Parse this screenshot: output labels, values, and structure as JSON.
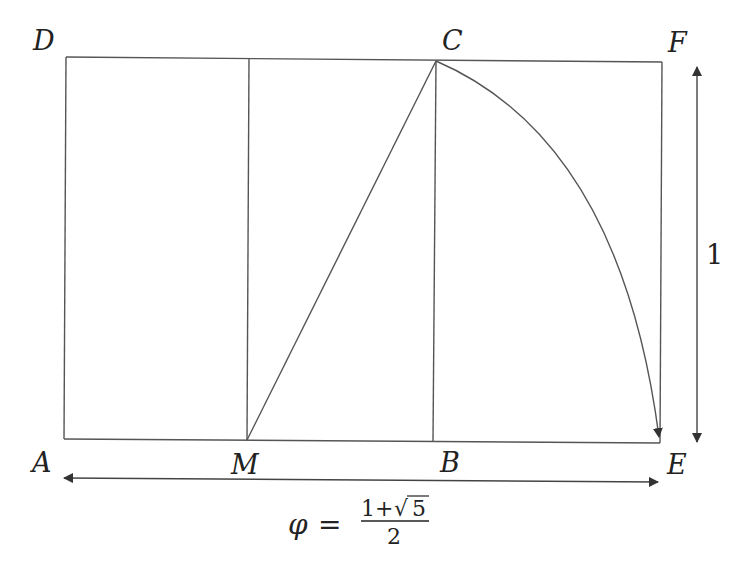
{
  "diagram": {
    "points": [
      {
        "id": "D",
        "label": "D",
        "x": 66,
        "y": 57
      },
      {
        "id": "C",
        "label": "C",
        "x": 436,
        "y": 61
      },
      {
        "id": "F",
        "label": "F",
        "x": 662,
        "y": 62
      },
      {
        "id": "A",
        "label": "A",
        "x": 64,
        "y": 439
      },
      {
        "id": "M",
        "label": "M",
        "x": 247,
        "y": 440
      },
      {
        "id": "B",
        "label": "B",
        "x": 433,
        "y": 441
      },
      {
        "id": "E",
        "label": "E",
        "x": 660,
        "y": 443
      }
    ],
    "labels": {
      "D": "D",
      "C": "C",
      "F": "F",
      "A": "A",
      "M": "M",
      "B": "B",
      "E": "E",
      "height": "1"
    },
    "formula": {
      "lhs": "φ",
      "equals": "=",
      "numerator_1": "1+",
      "radical": "√",
      "radicand": "5",
      "denominator": "2"
    },
    "segments": [
      {
        "from": "D",
        "to": "F",
        "name": "top-edge"
      },
      {
        "from": "A",
        "to": "E",
        "name": "bottom-edge"
      },
      {
        "from": "A",
        "to": "D",
        "name": "left-edge"
      },
      {
        "from": "E",
        "to": "F",
        "name": "right-edge"
      },
      {
        "from": "M",
        "to": "midline-top",
        "name": "midline"
      },
      {
        "from": "B",
        "to": "C",
        "name": "square-edge"
      },
      {
        "from": "M",
        "to": "C",
        "name": "diagonal-MC"
      }
    ],
    "arc": {
      "from": "C",
      "to": "E",
      "center": "M"
    },
    "dimension_arrows": [
      {
        "name": "width-arrow",
        "label": "φ = (1+√5)/2"
      },
      {
        "name": "height-arrow",
        "label": "1"
      }
    ],
    "colors": {
      "stroke": "#555555",
      "text": "#222222",
      "background": "#ffffff"
    }
  }
}
